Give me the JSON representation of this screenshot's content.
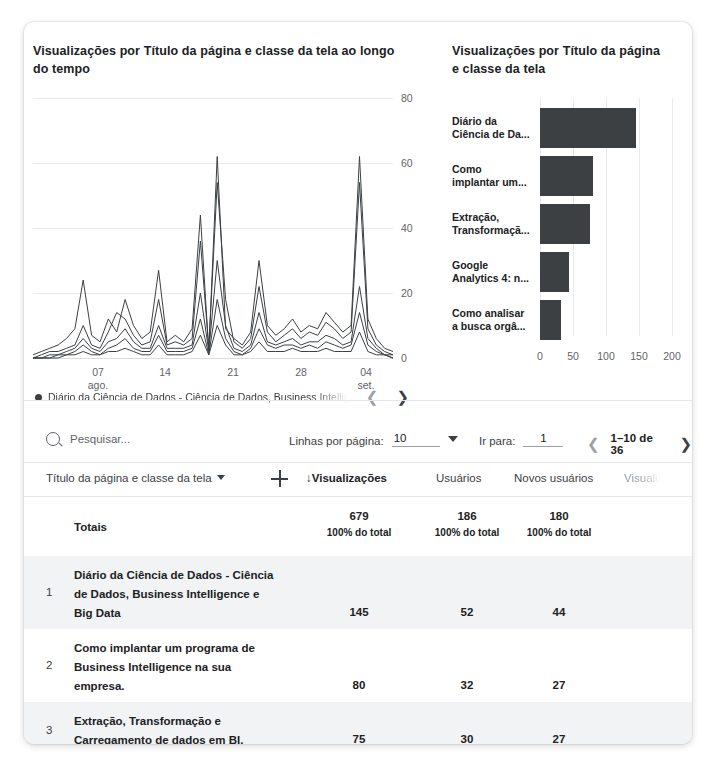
{
  "line_chart": {
    "title": "Visualizações por Título da página e classe da tela ao longo do tempo",
    "legend_label": "Diário da Ciência de Dados - Ciência de Dados, Business Intellig",
    "prev_icon": "chevron-left-icon",
    "next_icon": "chevron-right-icon"
  },
  "bar_chart": {
    "title": "Visualizações por Título da página e classe da tela"
  },
  "chart_data": [
    {
      "type": "line",
      "title": "Visualizações por Título da página e classe da tela ao longo do tempo",
      "xlabel": "",
      "ylabel": "",
      "ylim": [
        0,
        80
      ],
      "yticks": [
        0,
        20,
        40,
        60,
        80
      ],
      "grid": true,
      "legend_position": "bottom",
      "xticks": [
        "07\nago.",
        "14",
        "21",
        "28",
        "04\nset."
      ],
      "xtick_labels": [
        {
          "label": "07",
          "sub": "ago."
        },
        {
          "label": "14",
          "sub": ""
        },
        {
          "label": "21",
          "sub": ""
        },
        {
          "label": "28",
          "sub": ""
        },
        {
          "label": "04",
          "sub": "set."
        }
      ],
      "series": [
        {
          "name": "Diário da Ciência de Dados - Ciência de Dados, Business Intellig",
          "values": [
            1,
            2,
            3,
            4,
            6,
            9,
            24,
            7,
            5,
            12,
            8,
            18,
            10,
            6,
            8,
            27,
            5,
            7,
            5,
            9,
            44,
            2,
            62,
            9,
            6,
            4,
            8,
            30,
            10,
            7,
            9,
            12,
            8,
            10,
            9,
            14,
            11,
            8,
            10,
            62,
            12,
            6,
            3,
            2
          ]
        },
        {
          "name": "Como implantar um programa de Business Intelligence na sua empresa.",
          "values": [
            0,
            1,
            2,
            2,
            3,
            4,
            10,
            4,
            3,
            8,
            14,
            12,
            7,
            4,
            5,
            18,
            4,
            5,
            4,
            6,
            36,
            3,
            54,
            18,
            5,
            3,
            6,
            22,
            8,
            5,
            7,
            9,
            6,
            8,
            7,
            11,
            9,
            6,
            8,
            54,
            9,
            4,
            2,
            1
          ]
        },
        {
          "name": "Extração, Transformação e Carregamento de dados em BI.",
          "values": [
            0,
            0,
            1,
            1,
            2,
            3,
            6,
            3,
            2,
            5,
            6,
            9,
            5,
            3,
            3,
            10,
            3,
            3,
            3,
            4,
            20,
            2,
            30,
            10,
            3,
            2,
            4,
            14,
            5,
            4,
            5,
            6,
            4,
            5,
            5,
            7,
            6,
            4,
            5,
            22,
            6,
            3,
            1,
            1
          ]
        },
        {
          "name": "Google Analytics 4: novidades",
          "values": [
            0,
            0,
            0,
            1,
            1,
            2,
            4,
            2,
            1,
            3,
            4,
            6,
            3,
            2,
            2,
            7,
            2,
            2,
            2,
            3,
            12,
            1,
            18,
            6,
            2,
            1,
            3,
            9,
            4,
            3,
            4,
            4,
            3,
            4,
            3,
            5,
            4,
            3,
            4,
            14,
            4,
            2,
            1,
            0
          ]
        },
        {
          "name": "Como analisar a busca orgânica",
          "values": [
            0,
            0,
            0,
            0,
            1,
            1,
            2,
            1,
            1,
            2,
            2,
            3,
            2,
            1,
            1,
            4,
            1,
            1,
            1,
            2,
            7,
            1,
            10,
            4,
            1,
            1,
            2,
            5,
            2,
            2,
            2,
            3,
            2,
            2,
            2,
            3,
            2,
            2,
            2,
            8,
            2,
            1,
            1,
            0
          ]
        }
      ]
    },
    {
      "type": "bar",
      "orientation": "horizontal",
      "title": "Visualizações por Título da página e classe da tela",
      "xlabel": "",
      "ylabel": "",
      "xlim": [
        0,
        200
      ],
      "xticks": [
        0,
        50,
        100,
        150,
        200
      ],
      "categories": [
        "Diário da Ciência de Da...",
        "Como implantar um...",
        "Extração, Transformaçã...",
        "Google Analytics 4: n...",
        "Como analisar a busca orgâ..."
      ],
      "category_lines": [
        [
          "Diário da",
          "Ciência de Da..."
        ],
        [
          "Como",
          "implantar um..."
        ],
        [
          "Extração,",
          "Transformaçã..."
        ],
        [
          "Google",
          "Analytics 4: n..."
        ],
        [
          "Como analisar",
          "a busca orgâ..."
        ]
      ],
      "values": [
        145,
        80,
        75,
        44,
        32
      ],
      "bar_color": "#3c4043"
    }
  ],
  "toolbar": {
    "search_placeholder": "Pesquisar...",
    "search_icon": "search-icon",
    "rows_per_page_label": "Linhas por página:",
    "rows_per_page_value": "10",
    "goto_label": "Ir para:",
    "goto_value": "1",
    "pager_text": "1–10 de 36",
    "prev_icon": "chevron-left-icon",
    "next_icon": "chevron-right-icon"
  },
  "table": {
    "columns": {
      "dimension": "Título da página e classe da tela",
      "views": "↓Visualizações",
      "users": "Usuários",
      "new_users": "Novos usuários",
      "partial": "Visualiz"
    },
    "totals": {
      "label": "Totais",
      "views": "679",
      "views_sub": "100% do total",
      "users": "186",
      "users_sub": "100% do total",
      "new_users": "180",
      "new_users_sub": "100% do total"
    },
    "rows": [
      {
        "index": "1",
        "name": "Diário da Ciência de Dados - Ciência de Dados, Business Intelligence e Big Data",
        "views": "145",
        "users": "52",
        "new_users": "44"
      },
      {
        "index": "2",
        "name": "Como implantar um programa de Business Intelligence na sua empresa.",
        "views": "80",
        "users": "32",
        "new_users": "27"
      },
      {
        "index": "3",
        "name": "Extração, Transformação e Carregamento de dados em BI.",
        "views": "75",
        "users": "30",
        "new_users": "27"
      }
    ]
  },
  "colors": {
    "accent": "#3c4043",
    "grid": "#e8eaed",
    "alt_row": "#f1f3f4"
  }
}
